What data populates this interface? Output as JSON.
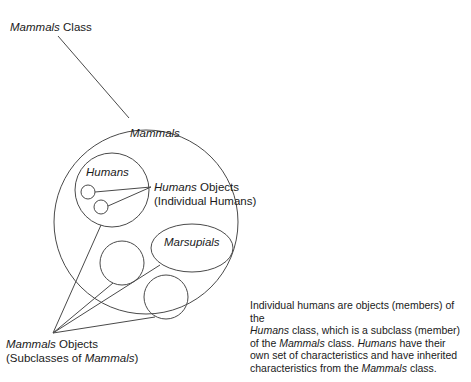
{
  "figure": {
    "type": "venn-nested-set-diagram"
  },
  "labels": {
    "mammals_class": {
      "emphasis": "Mammals",
      "rest": " Class"
    },
    "mammals": "Mammals",
    "humans": "Humans",
    "marsupials": "Marsupials",
    "humans_objects": {
      "line1_emphasis": "Humans",
      "line1_rest": " Objects",
      "line2": "(Individual Humans)"
    },
    "mammals_objects": {
      "line1_emphasis": "Mammals",
      "line1_rest": " Objects",
      "line2_pre": "(Subclasses of ",
      "line2_emphasis": "Mammals",
      "line2_post": ")"
    }
  },
  "paragraph": {
    "line1": "Individual humans are objects (members) of the",
    "line2_emphasis": "Humans",
    "line2_rest": " class, which is a subclass (member)",
    "line3_pre": "of the ",
    "line3_emphasis1": "Mammals",
    "line3_mid": " class. ",
    "line3_emphasis2": "Humans",
    "line3_post": " have their",
    "line4": "own set of characteristics and have inherited",
    "line5_pre": "characteristics from the ",
    "line5_emphasis": "Mammals",
    "line5_post": " class."
  },
  "shapes": {
    "mammals_circle": {
      "cx": 146,
      "cy": 222,
      "r": 92
    },
    "humans_circle": {
      "cx": 112,
      "cy": 190,
      "r": 37
    },
    "marsupials_ellipse": {
      "cx": 192,
      "cy": 248,
      "rx": 41,
      "ry": 24
    },
    "human_object_1": {
      "cx": 88,
      "cy": 192,
      "r": 7
    },
    "human_object_2": {
      "cx": 101,
      "cy": 207,
      "r": 7
    },
    "mammals_object_1": {
      "cx": 122,
      "cy": 263,
      "r": 22
    },
    "mammals_object_2": {
      "cx": 166,
      "cy": 297,
      "r": 22
    }
  },
  "colors": {
    "stroke": "#4a4a4a",
    "text": "#1a1a1a",
    "background": "#ffffff"
  }
}
